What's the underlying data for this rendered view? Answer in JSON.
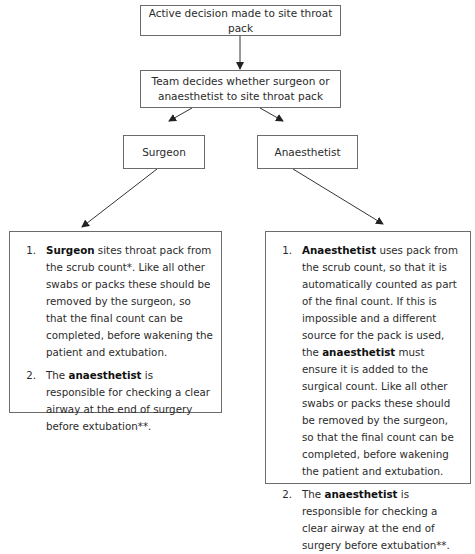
{
  "diagram": {
    "top_node": "Active decision made to site throat pack",
    "team_node": "Team decides whether surgeon or anaesthetist to site throat pack",
    "branches": [
      {
        "label": "Surgeon",
        "steps": [
          {
            "number": "1.",
            "bold": "Surgeon",
            "rest": " sites throat pack from the scrub count*. Like all other swabs or packs these should be removed by the surgeon, so that the final count can be completed, before wakening the patient and extubation."
          },
          {
            "number": "2.",
            "prefix": "The ",
            "bold": "anaesthetist",
            "rest": " is responsible for checking a clear airway at the end of surgery before extubation**."
          }
        ]
      },
      {
        "label": "Anaesthetist",
        "steps": [
          {
            "number": "1.",
            "bold": "Anaesthetist",
            "rest": " uses pack from the scrub count, so that it is automatically counted as part of the final count. If this is impossible and a different source for the pack is used, the ",
            "bold2": "anaesthetist",
            "rest2": " must ensure it is added to the surgical count. Like all other swabs or packs these should be removed by the surgeon, so that the final count can be completed, before wakening the patient and extubation."
          },
          {
            "number": "2.",
            "prefix": "The ",
            "bold": "anaesthetist",
            "rest": " is responsible for checking a clear airway at the end of surgery before extubation**."
          }
        ]
      }
    ],
    "colors": {
      "border": "#6b6b6b",
      "arrow": "#333333",
      "text": "#2b2b2b"
    }
  }
}
